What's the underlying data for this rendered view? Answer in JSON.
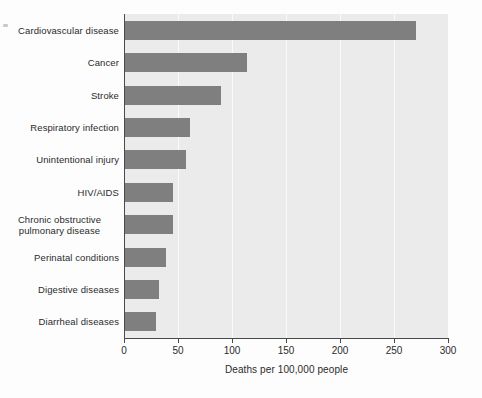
{
  "chart_data": {
    "type": "bar",
    "orientation": "horizontal",
    "title": "",
    "subtitle": "",
    "xlabel": "Deaths per 100,000 people",
    "ylabel": "",
    "xlim": [
      0,
      300
    ],
    "xticks": [
      0,
      50,
      100,
      150,
      200,
      250,
      300
    ],
    "xtick_labels": [
      "0",
      "50",
      "100",
      "150",
      "200",
      "250",
      "300"
    ],
    "grid": true,
    "grid_axis": "x",
    "legend": false,
    "legend_position": "none",
    "categories": [
      "Cardiovascular disease",
      "Cancer",
      "Stroke",
      "Respiratory infection",
      "Unintentional injury",
      "HIV/AIDS",
      "Chronic obstructive pulmonary disease",
      "Perinatal conditions",
      "Digestive diseases",
      "Diarrheal diseases"
    ],
    "category_label_lines": [
      [
        "Cardiovascular disease"
      ],
      [
        "Cancer"
      ],
      [
        "Stroke"
      ],
      [
        "Respiratory infection"
      ],
      [
        "Unintentional injury"
      ],
      [
        "HIV/AIDS"
      ],
      [
        "Chronic obstructive",
        "pulmonary disease"
      ],
      [
        "Perinatal conditions"
      ],
      [
        "Digestive diseases"
      ],
      [
        "Diarrheal diseases"
      ]
    ],
    "values": [
      270,
      114,
      90,
      61,
      57,
      45,
      45,
      39,
      32,
      30
    ],
    "series": [
      {
        "name": "Deaths per 100,000 people",
        "values": [
          270,
          114,
          90,
          61,
          57,
          45,
          45,
          39,
          32,
          30
        ]
      }
    ]
  },
  "style": {
    "bar_color": "#7f7f7f",
    "plot_background": "#ebebeb",
    "gridline_color": "#fafafa",
    "axis_color": "#4a4a4a",
    "text_color": "#2b2b2b",
    "figure_background": "#fdfdfd"
  }
}
